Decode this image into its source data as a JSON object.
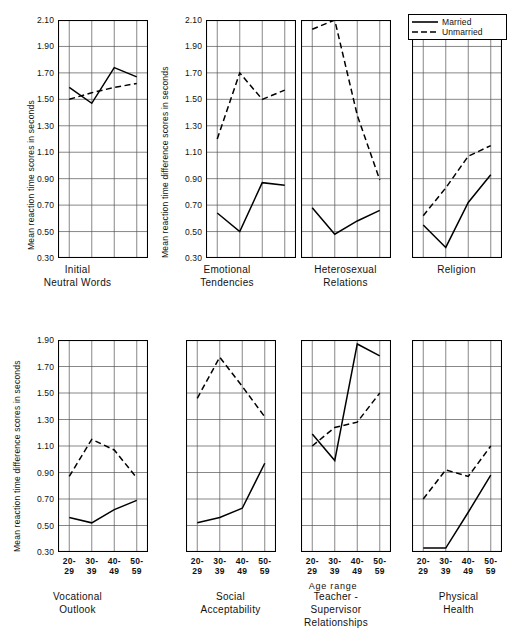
{
  "figure": {
    "x_axis_name": "Age range",
    "y_label_top_left": "Mean reaction time scores in seconds",
    "y_label_difference": "Mean reaction time difference scores in seconds",
    "legend": {
      "married_label": "Married",
      "unmarried_label": "Unmarried"
    },
    "categories": [
      "20-\n29",
      "30-\n39",
      "40-\n49",
      "50-\n59"
    ],
    "captions": {
      "p1": "Initial\nNeutral  Words",
      "p2": "Emotional\nTendencies",
      "p3": "Heterosexual\nRelations",
      "p4": "Religion",
      "p5": "Vocational\nOutlook",
      "p6": "Social\nAcceptability",
      "p7": "Teacher -\nSupervisor\nRelationships",
      "p8": "Physical\nHealth"
    },
    "yticks_top": [
      "2.10",
      "1.90",
      "1.70",
      "1.50",
      "1.30",
      "1.10",
      "0.90",
      "0.70",
      "0.50",
      "0.30"
    ],
    "yticks_bottom": [
      "1.90",
      "1.70",
      "1.50",
      "1.30",
      "1.10",
      "0.90",
      "0.70",
      "0.50",
      "0.30"
    ]
  },
  "chart_data": [
    {
      "type": "line",
      "panel": 1,
      "title": "Initial Neutral Words",
      "xlabel": "Age range",
      "ylabel": "Mean reaction time scores in seconds",
      "categories": [
        "20-29",
        "30-39",
        "40-49",
        "50-59"
      ],
      "ylim": [
        0.3,
        2.1
      ],
      "ytick_step": 0.2,
      "grid": true,
      "legend_position": "top-right (shared, shown on Religion panel)",
      "series": [
        {
          "name": "Married",
          "style": "solid",
          "values": [
            1.59,
            1.47,
            1.74,
            1.67
          ]
        },
        {
          "name": "Unmarried",
          "style": "dashed",
          "values": [
            1.5,
            1.55,
            1.59,
            1.62
          ]
        }
      ]
    },
    {
      "type": "line",
      "panel": 2,
      "title": "Emotional Tendencies",
      "xlabel": "Age range",
      "ylabel": "Mean reaction time difference scores in seconds",
      "categories": [
        "20-29",
        "30-39",
        "40-49",
        "50-59"
      ],
      "ylim": [
        0.3,
        2.1
      ],
      "ytick_step": 0.2,
      "grid": true,
      "series": [
        {
          "name": "Married",
          "style": "solid",
          "values": [
            0.64,
            0.5,
            0.87,
            0.85
          ]
        },
        {
          "name": "Unmarried",
          "style": "dashed",
          "values": [
            1.2,
            1.7,
            1.5,
            1.57
          ]
        }
      ]
    },
    {
      "type": "line",
      "panel": 3,
      "title": "Heterosexual Relations",
      "xlabel": "Age range",
      "ylabel": "Mean reaction time difference scores in seconds",
      "categories": [
        "20-29",
        "30-39",
        "40-49",
        "50-59"
      ],
      "ylim": [
        0.3,
        2.1
      ],
      "ytick_step": 0.2,
      "grid": true,
      "series": [
        {
          "name": "Married",
          "style": "solid",
          "values": [
            0.68,
            0.48,
            0.58,
            0.66
          ]
        },
        {
          "name": "Unmarried",
          "style": "dashed",
          "values": [
            2.03,
            2.1,
            1.38,
            0.89
          ]
        }
      ]
    },
    {
      "type": "line",
      "panel": 4,
      "title": "Religion",
      "xlabel": "Age range",
      "ylabel": "Mean reaction time difference scores in seconds",
      "categories": [
        "20-29",
        "30-39",
        "40-49",
        "50-59"
      ],
      "ylim": [
        0.3,
        2.1
      ],
      "ytick_step": 0.2,
      "grid": true,
      "series": [
        {
          "name": "Married",
          "style": "solid",
          "values": [
            0.55,
            0.38,
            0.72,
            0.93
          ]
        },
        {
          "name": "Unmarried",
          "style": "dashed",
          "values": [
            0.62,
            0.83,
            1.07,
            1.15
          ]
        }
      ]
    },
    {
      "type": "line",
      "panel": 5,
      "title": "Vocational Outlook",
      "xlabel": "Age range",
      "ylabel": "Mean reaction time difference scores in seconds",
      "categories": [
        "20-29",
        "30-39",
        "40-49",
        "50-59"
      ],
      "ylim": [
        0.3,
        1.9
      ],
      "ytick_step": 0.2,
      "grid": true,
      "series": [
        {
          "name": "Married",
          "style": "solid",
          "values": [
            0.56,
            0.52,
            0.62,
            0.69
          ]
        },
        {
          "name": "Unmarried",
          "style": "dashed",
          "values": [
            0.87,
            1.15,
            1.07,
            0.86
          ]
        }
      ]
    },
    {
      "type": "line",
      "panel": 6,
      "title": "Social Acceptability",
      "xlabel": "Age range",
      "ylabel": "Mean reaction time difference scores in seconds",
      "categories": [
        "20-29",
        "30-39",
        "40-49",
        "50-59"
      ],
      "ylim": [
        0.3,
        1.9
      ],
      "ytick_step": 0.2,
      "grid": true,
      "series": [
        {
          "name": "Married",
          "style": "solid",
          "values": [
            0.52,
            0.56,
            0.63,
            0.97
          ]
        },
        {
          "name": "Unmarried",
          "style": "dashed",
          "values": [
            1.46,
            1.77,
            1.55,
            1.32
          ]
        }
      ]
    },
    {
      "type": "line",
      "panel": 7,
      "title": "Teacher - Supervisor Relationships",
      "xlabel": "Age range",
      "ylabel": "Mean reaction time difference scores in seconds",
      "categories": [
        "20-29",
        "30-39",
        "40-49",
        "50-59"
      ],
      "ylim": [
        0.3,
        1.9
      ],
      "ytick_step": 0.2,
      "grid": true,
      "series": [
        {
          "name": "Married",
          "style": "solid",
          "values": [
            1.19,
            0.99,
            1.87,
            1.78
          ]
        },
        {
          "name": "Unmarried",
          "style": "dashed",
          "values": [
            1.1,
            1.24,
            1.28,
            1.5
          ]
        }
      ]
    },
    {
      "type": "line",
      "panel": 8,
      "title": "Physical Health",
      "xlabel": "Age range",
      "ylabel": "Mean reaction time difference scores in seconds",
      "categories": [
        "20-29",
        "30-39",
        "40-49",
        "50-59"
      ],
      "ylim": [
        0.3,
        1.9
      ],
      "ytick_step": 0.2,
      "grid": true,
      "series": [
        {
          "name": "Married",
          "style": "solid",
          "values": [
            0.33,
            0.33,
            0.6,
            0.88
          ]
        },
        {
          "name": "Unmarried",
          "style": "dashed",
          "values": [
            0.7,
            0.92,
            0.87,
            1.1
          ]
        }
      ]
    }
  ]
}
